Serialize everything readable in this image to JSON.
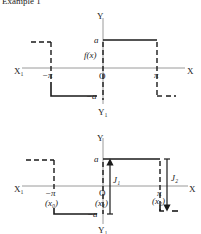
{
  "header": {
    "text": "Example 1"
  },
  "figure_top": {
    "axis_labels": {
      "x_pos": "X",
      "x_neg": "X₁",
      "y_pos": "Y",
      "y_neg": "Y₁",
      "origin": "O"
    },
    "tick_labels": {
      "neg_pi": "−π",
      "pi": "π",
      "a": "a",
      "neg_a": "−a"
    },
    "function_label": "f(x)"
  },
  "figure_bottom": {
    "axis_labels": {
      "x_pos": "X",
      "x_neg": "X₁",
      "y_pos": "Y",
      "y_neg": "Y₁",
      "origin": "O"
    },
    "tick_labels": {
      "neg_pi": "−π",
      "pi": "π",
      "a": "a",
      "neg_a": "−a"
    },
    "point_labels": {
      "x0": "(x₀)",
      "x1": "(x₁)",
      "x2": "(x₂)"
    },
    "jump_labels": {
      "j1": "J₁",
      "j2": "J₂"
    }
  }
}
